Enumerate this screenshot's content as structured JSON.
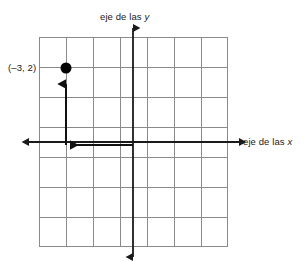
{
  "figure": {
    "kind": "coordinate-plane-diagram",
    "background_color": "#ffffff",
    "grid_color": "#808080",
    "axis_color": "#1a1a1a",
    "vector_color": "#1a1a1a",
    "point_color": "#000000"
  },
  "labels": {
    "y_axis_prefix": "eje de las ",
    "y_axis_var": "y",
    "x_axis_prefix": "eje de las ",
    "x_axis_var": "x",
    "point_label": "(–3, 2)"
  },
  "grid": {
    "columns": 7,
    "rows": 7,
    "cell_width": 27,
    "cell_height": 30,
    "left": 39,
    "top": 37,
    "right": 228,
    "bottom": 247
  },
  "axes": {
    "origin_x": 133,
    "origin_y": 142,
    "x_start": 28,
    "x_end": 240,
    "y_start": 27,
    "y_end": 258
  },
  "plotted_point": {
    "label": "(–3, 2)",
    "x": -3,
    "y": 2,
    "pixel_x": 66,
    "pixel_y": 68,
    "radius": 5.5
  },
  "vectors": [
    {
      "name": "horizontal-run-arrow",
      "from_x": 133,
      "from_y": 144,
      "to_x": 63,
      "to_y": 144,
      "direction": "left",
      "represents": "x = -3"
    },
    {
      "name": "vertical-rise-arrow",
      "from_x": 66,
      "from_y": 142,
      "to_x": 66,
      "to_y": 75,
      "direction": "up",
      "represents": "y = 2"
    }
  ]
}
